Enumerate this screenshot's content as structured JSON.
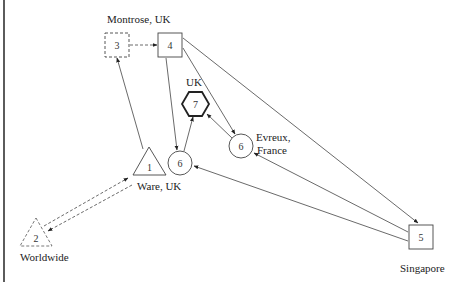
{
  "diagram": {
    "type": "supply-network",
    "nodes": [
      {
        "id": "n1",
        "number": "1",
        "shape": "triangle",
        "style": "solid",
        "label": "Ware, UK"
      },
      {
        "id": "n2",
        "number": "2",
        "shape": "triangle",
        "style": "dashed",
        "label": "Worldwide"
      },
      {
        "id": "n3",
        "number": "3",
        "shape": "square",
        "style": "dashed",
        "label": "Montrose, UK"
      },
      {
        "id": "n4",
        "number": "4",
        "shape": "square",
        "style": "solid",
        "label": ""
      },
      {
        "id": "n5",
        "number": "5",
        "shape": "square",
        "style": "solid",
        "label": "Singapore"
      },
      {
        "id": "n6a",
        "number": "6",
        "shape": "circle",
        "style": "solid",
        "label": ""
      },
      {
        "id": "n6b",
        "number": "6",
        "shape": "circle",
        "style": "solid",
        "label_line1": "Evreux,",
        "label_line2": "France"
      },
      {
        "id": "n7",
        "number": "7",
        "shape": "hexagon",
        "style": "bold",
        "label": "UK"
      }
    ],
    "edges": [
      {
        "from": "n3",
        "to": "n4",
        "style": "dashed"
      },
      {
        "from": "n1",
        "to": "n3",
        "style": "solid"
      },
      {
        "from": "n4",
        "to": "n6a",
        "style": "solid"
      },
      {
        "from": "n4",
        "to": "n6b",
        "style": "solid"
      },
      {
        "from": "n4",
        "to": "n5",
        "style": "solid"
      },
      {
        "from": "n6a",
        "to": "n7",
        "style": "solid"
      },
      {
        "from": "n6b",
        "to": "n7",
        "style": "solid"
      },
      {
        "from": "n5",
        "to": "n6b",
        "style": "solid"
      },
      {
        "from": "n5",
        "to": "n6a",
        "style": "solid"
      },
      {
        "from": "n2",
        "to": "n1",
        "style": "dashed"
      },
      {
        "from": "n1",
        "to": "n2",
        "style": "dashed"
      }
    ]
  },
  "labels": {
    "montrose": "Montrose, UK",
    "uk": "UK",
    "evreux_line1": "Evreux,",
    "evreux_line2": "France",
    "ware": "Ware, UK",
    "worldwide": "Worldwide",
    "singapore": "Singapore"
  },
  "numbers": {
    "n1": "1",
    "n2": "2",
    "n3": "3",
    "n4": "4",
    "n5": "5",
    "n6a": "6",
    "n6b": "6",
    "n7": "7"
  }
}
